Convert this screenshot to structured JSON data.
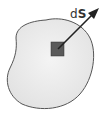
{
  "diagram": {
    "label_d": "d",
    "label_s": "S",
    "colors": {
      "surface_fill": "#ededed",
      "surface_stroke": "#555555",
      "element_fill": "#5a5a5a",
      "arrow": "#222222"
    }
  }
}
